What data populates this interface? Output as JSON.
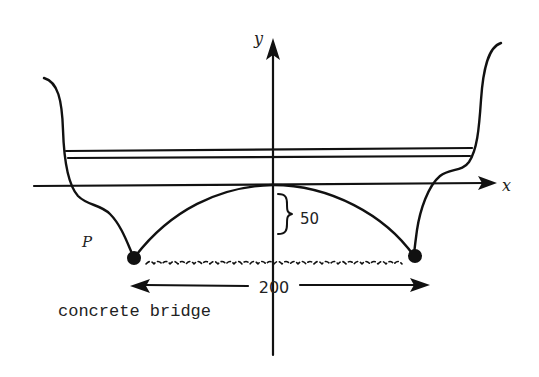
{
  "diagram": {
    "axes": {
      "x_label": "x",
      "y_label": "y"
    },
    "labels": {
      "point": "P",
      "height": "50",
      "span": "200",
      "caption": "concrete bridge"
    },
    "elements": [
      {
        "id": "x-axis",
        "type": "arrow",
        "description": "horizontal x-axis with arrow to the right"
      },
      {
        "id": "y-axis",
        "type": "arrow",
        "description": "vertical y-axis with arrow upward"
      },
      {
        "id": "road-deck",
        "type": "parallel-lines",
        "description": "two parallel horizontal lines spanning between banks"
      },
      {
        "id": "arch",
        "type": "curve",
        "description": "parabolic arch with vertex at origin, opening downward"
      },
      {
        "id": "left-bank",
        "type": "curve",
        "description": "left river bank profile"
      },
      {
        "id": "right-bank",
        "type": "curve",
        "description": "right river bank profile"
      },
      {
        "id": "water",
        "type": "wavy-line",
        "description": "water surface between the arch endpoints"
      },
      {
        "id": "height-brace",
        "type": "brace",
        "description": "brace marking arch height of 50"
      },
      {
        "id": "span-arrow",
        "type": "double-arrow",
        "description": "double-headed arrow marking span of 200"
      },
      {
        "id": "endpoint-left",
        "type": "dot",
        "description": "left arch endpoint P"
      },
      {
        "id": "endpoint-right",
        "type": "dot",
        "description": "right arch endpoint"
      }
    ],
    "colors": {
      "ink": "#111111",
      "background": "#ffffff"
    }
  }
}
